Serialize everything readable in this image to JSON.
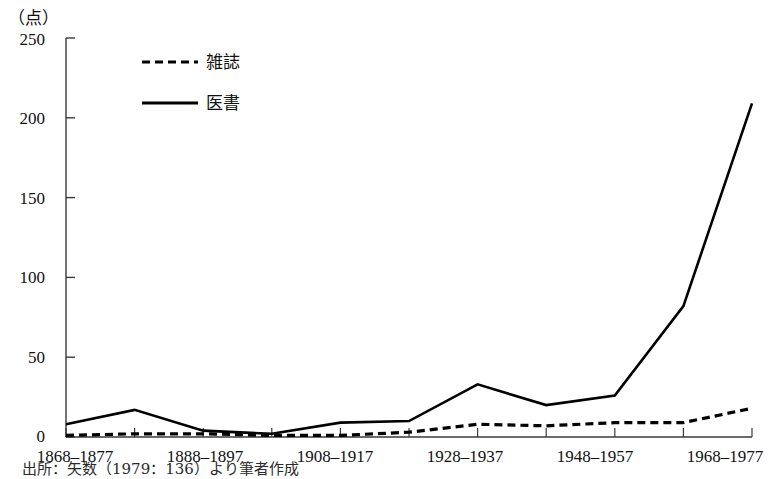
{
  "figure": {
    "unit_label": "（点）",
    "source_note": "出所：矢数（1979：136）より筆者作成"
  },
  "legend": {
    "position": "top-left-inside",
    "entries": [
      {
        "label": "雑誌",
        "style": "dashed",
        "color": "#000000"
      },
      {
        "label": "医書",
        "style": "solid",
        "color": "#000000"
      }
    ]
  },
  "axes": {
    "y": {
      "label": "（点）",
      "min": 0,
      "max": 250,
      "step": 50,
      "ticks": [
        "0",
        "50",
        "100",
        "150",
        "200",
        "250"
      ]
    },
    "x": {
      "label": "",
      "all_categories": [
        "1868–1877",
        "1878–1887",
        "1888–1897",
        "1898–1907",
        "1908–1917",
        "1918–1927",
        "1928–1937",
        "1938–1947",
        "1948–1957",
        "1958–1967",
        "1968–1977"
      ],
      "visible_tick_labels": [
        "1868–1877",
        "1888–1897",
        "1908–1917",
        "1928–1937",
        "1948–1957",
        "1968–1977"
      ]
    }
  },
  "chart_data": {
    "type": "line",
    "title": "",
    "subtitle": "",
    "xlabel": "",
    "ylabel": "（点）",
    "ylim": [
      0,
      250
    ],
    "grid": false,
    "legend_position": "upper left",
    "categories": [
      "1868–1877",
      "1878–1887",
      "1888–1897",
      "1898–1907",
      "1908–1917",
      "1918–1927",
      "1928–1937",
      "1938–1947",
      "1948–1957",
      "1958–1967",
      "1968–1977"
    ],
    "series": [
      {
        "name": "雑誌",
        "style": "dashed",
        "color": "#000000",
        "values": [
          1,
          2,
          2,
          1,
          1,
          3,
          8,
          7,
          9,
          9,
          18
        ]
      },
      {
        "name": "医書",
        "style": "solid",
        "color": "#000000",
        "values": [
          8,
          17,
          4,
          2,
          9,
          10,
          33,
          20,
          26,
          82,
          209
        ]
      }
    ],
    "annotations": [
      "出所：矢数（1979：136）より筆者作成"
    ]
  }
}
